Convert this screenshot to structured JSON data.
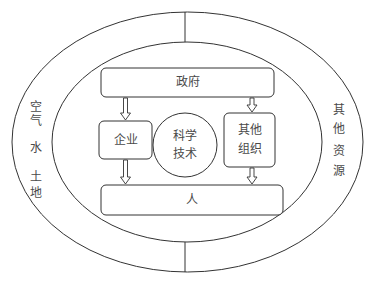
{
  "diagram": {
    "outer_ring": {
      "left_labels": [
        "空",
        "气",
        "水",
        "土",
        "地"
      ],
      "right_labels": [
        "其",
        "他",
        "资",
        "源"
      ]
    },
    "nodes": {
      "government": "政府",
      "enterprise": "企业",
      "science_tech": [
        "科学",
        "技术"
      ],
      "other_orgs": [
        "其他",
        "组织"
      ],
      "people": "人"
    },
    "edges": [
      {
        "from": "政府",
        "to": "企业"
      },
      {
        "from": "政府",
        "to": "其他组织"
      },
      {
        "from": "企业",
        "to": "人"
      },
      {
        "from": "其他组织",
        "to": "人"
      }
    ],
    "colors": {
      "stroke": "#333333",
      "text": "#4a4a4a",
      "background": "#ffffff"
    }
  }
}
